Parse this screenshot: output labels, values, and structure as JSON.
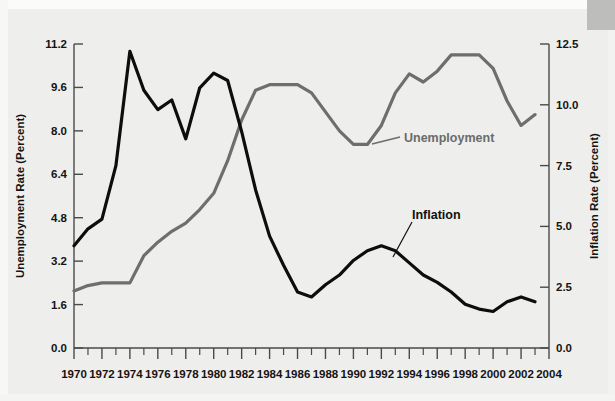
{
  "figure": {
    "background_color": "#eeeeec",
    "inflation_color": "#0d0d0d",
    "unemployment_color": "#6e6e6e"
  },
  "annotations": {
    "unemployment_label": "Unemployment",
    "inflation_label": "Inflation"
  },
  "axes": {
    "left_title": "Unemployment Rate (Percent)",
    "right_title": "Inflation Rate (Percent)",
    "left_ticks": [
      "0.0",
      "1.6",
      "3.2",
      "4.8",
      "6.4",
      "8.0",
      "9.6",
      "11.2"
    ],
    "right_ticks": [
      "0.0",
      "2.5",
      "5.0",
      "7.5",
      "10.0",
      "12.5"
    ],
    "x_ticks": [
      "1970",
      "1972",
      "1974",
      "1976",
      "1978",
      "1980",
      "1982",
      "1984",
      "1986",
      "1988",
      "1990",
      "1992",
      "1994",
      "1996",
      "1998",
      "2000",
      "2002",
      "2004"
    ]
  },
  "chart_data": {
    "type": "line",
    "title": "",
    "xlabel": "",
    "ylabel": "Unemployment Rate (Percent)",
    "y2label": "Inflation Rate (Percent)",
    "xlim": [
      1970,
      2004
    ],
    "ylim": [
      0.0,
      11.2
    ],
    "y2lim": [
      0.0,
      12.5
    ],
    "grid": false,
    "legend_position": "inline-annotations",
    "x": [
      1970,
      1971,
      1972,
      1973,
      1974,
      1975,
      1976,
      1977,
      1978,
      1979,
      1980,
      1981,
      1982,
      1983,
      1984,
      1985,
      1986,
      1987,
      1988,
      1989,
      1990,
      1991,
      1992,
      1993,
      1994,
      1995,
      1996,
      1997,
      1998,
      1999,
      2000,
      2001,
      2002,
      2003
    ],
    "series": [
      {
        "name": "Unemployment",
        "axis": "left",
        "color": "#6e6e6e",
        "units": "percent",
        "values": [
          2.1,
          2.3,
          2.4,
          2.4,
          2.4,
          3.4,
          3.9,
          4.3,
          4.6,
          5.1,
          5.7,
          6.9,
          8.4,
          9.5,
          9.7,
          9.7,
          9.7,
          9.4,
          8.7,
          8.0,
          7.5,
          7.5,
          8.2,
          9.4,
          10.1,
          9.8,
          10.2,
          10.8,
          10.8,
          10.8,
          10.3,
          9.1,
          8.2,
          8.6
        ]
      },
      {
        "name": "Inflation",
        "axis": "right",
        "color": "#0d0d0d",
        "units": "percent",
        "values": [
          4.2,
          4.9,
          5.3,
          7.5,
          12.2,
          10.6,
          9.8,
          10.2,
          8.6,
          10.7,
          11.3,
          11.0,
          8.9,
          6.5,
          4.6,
          3.4,
          2.3,
          2.1,
          2.6,
          3.0,
          3.6,
          4.0,
          4.2,
          4.0,
          3.5,
          3.0,
          2.7,
          2.3,
          1.8,
          1.6,
          1.5,
          1.9,
          2.1,
          1.9
        ]
      }
    ]
  }
}
